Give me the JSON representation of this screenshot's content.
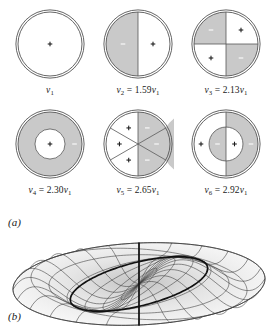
{
  "figure": {
    "panels": [
      {
        "letter": "(a)",
        "name": "mode-shape-diagrams"
      },
      {
        "letter": "(b)",
        "name": "three-dimensional-drumhead-surface"
      }
    ]
  },
  "colors": {
    "gray_fill": "#c9c9c9",
    "white_fill": "#ffffff",
    "outline": "#555555",
    "sign_dark": "#1a1a1a",
    "sign_light": "#ffffff",
    "mesh_line": "#3c3c3c",
    "nodal_line": "#111111"
  },
  "modes": [
    {
      "id": "mode-1",
      "label_main": "ν",
      "label_sub": "1",
      "label_rest": "",
      "label_text": "ν₁",
      "pattern": "uniform",
      "frequency_ratio": 1.0,
      "regions": [
        {
          "fill": "white",
          "sign": "+"
        }
      ]
    },
    {
      "id": "mode-2",
      "label_main": "ν",
      "label_sub": "2",
      "label_rest": " = 1.59ν",
      "label_text": "ν₂ = 1.59ν₁",
      "pattern": "half-split-vertical",
      "frequency_ratio": 1.59,
      "regions": [
        {
          "fill": "gray",
          "sign": "−"
        },
        {
          "fill": "white",
          "sign": "+"
        }
      ]
    },
    {
      "id": "mode-3",
      "label_main": "ν",
      "label_sub": "3",
      "label_rest": " = 2.13ν",
      "label_text": "ν₃ = 2.13ν₁",
      "pattern": "quadrants",
      "frequency_ratio": 2.13,
      "regions": [
        {
          "fill": "gray",
          "sign": "−"
        },
        {
          "fill": "white",
          "sign": "+"
        },
        {
          "fill": "white",
          "sign": "+"
        },
        {
          "fill": "gray",
          "sign": "−"
        }
      ]
    },
    {
      "id": "mode-4",
      "label_main": "ν",
      "label_sub": "4",
      "label_rest": " = 2.30ν",
      "label_text": "ν₄ = 2.30ν₁",
      "pattern": "annulus",
      "frequency_ratio": 2.3,
      "regions": [
        {
          "fill": "gray",
          "sign": "−"
        },
        {
          "fill": "white",
          "sign": "+"
        }
      ]
    },
    {
      "id": "mode-5",
      "label_main": "ν",
      "label_sub": "5",
      "label_rest": " = 2.65ν",
      "label_text": "ν₅ = 2.65ν₁",
      "pattern": "six-sectors",
      "frequency_ratio": 2.65,
      "regions": [
        {
          "fill": "white",
          "sign": "+"
        },
        {
          "fill": "gray",
          "sign": "−"
        },
        {
          "fill": "white",
          "sign": "+"
        },
        {
          "fill": "gray",
          "sign": "−"
        },
        {
          "fill": "white",
          "sign": "+"
        },
        {
          "fill": "gray",
          "sign": "−"
        }
      ]
    },
    {
      "id": "mode-6",
      "label_main": "ν",
      "label_sub": "6",
      "label_rest": " = 2.92ν",
      "label_text": "ν₆ = 2.92ν₁",
      "pattern": "half-split-with-core",
      "frequency_ratio": 2.92,
      "regions": [
        {
          "fill": "white",
          "sign": "+"
        },
        {
          "fill": "gray",
          "sign": "−"
        },
        {
          "fill": "gray",
          "sign": "−"
        },
        {
          "fill": "white",
          "sign": "+"
        }
      ]
    }
  ],
  "surface_plot": {
    "name": "drumhead-surface",
    "type": "3d-wireframe-mesh",
    "shape": "circular membrane in perspective (elliptical outline)",
    "radial_lines": 24,
    "circular_lines": 7,
    "nodal_diameter_count": 1,
    "nodal_circle_count": 1,
    "mode_m": 1,
    "mode_n": 2
  }
}
